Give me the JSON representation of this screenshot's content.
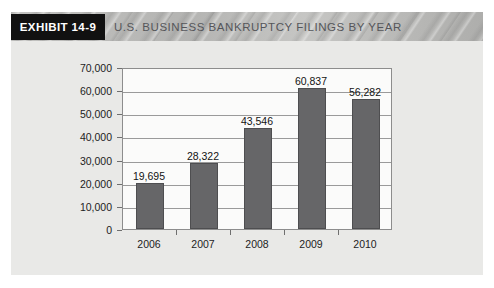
{
  "header": {
    "badge_label": "EXHIBIT 14-9",
    "title": "U.S. BUSINESS BANKRUPTCY FILINGS BY YEAR",
    "badge_bg": "#111111",
    "badge_text_color": "#ffffff",
    "strip_bg": "#b9b9b7",
    "title_color": "#55565a"
  },
  "figure": {
    "body_bg": "#e9e9e7"
  },
  "chart_data": {
    "type": "bar",
    "title": "U.S. BUSINESS BANKRUPTCY FILINGS BY YEAR",
    "categories": [
      "2006",
      "2007",
      "2008",
      "2009",
      "2010"
    ],
    "values": [
      19695,
      28322,
      43546,
      60837,
      56282
    ],
    "value_labels": [
      "19,695",
      "28,322",
      "43,546",
      "60,837",
      "56,282"
    ],
    "xlabel": "",
    "ylabel": "",
    "ylim": [
      0,
      70000
    ],
    "ytick_values": [
      0,
      10000,
      20000,
      30000,
      40000,
      50000,
      60000,
      70000
    ],
    "ytick_labels": [
      "0",
      "10,000",
      "20,000",
      "30,000",
      "40,000",
      "50,000",
      "60,000",
      "70,000"
    ],
    "grid": "horizontal",
    "legend": "none",
    "bar_color": "#666668",
    "bar_border_color": "#4e4e50",
    "plot_bg": "#fbfbfa",
    "gridline_color": "#9a9a9a",
    "axis_color": "#8d8d8d"
  }
}
